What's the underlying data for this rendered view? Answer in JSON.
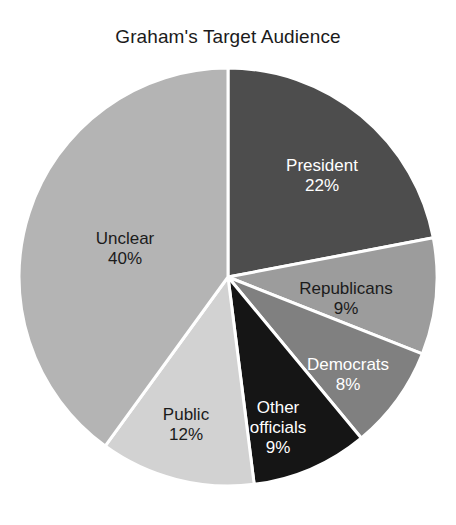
{
  "chart_data": {
    "type": "pie",
    "title": "Graham's Target Audience",
    "xlabel": "",
    "ylabel": "",
    "legend": "none",
    "grid": false,
    "start_angle_deg": 0,
    "direction": "clockwise",
    "categories": [
      "President",
      "Republicans",
      "Democrats",
      "Other officials",
      "Public",
      "Unclear"
    ],
    "values": [
      22,
      9,
      8,
      9,
      12,
      40
    ],
    "value_suffix": "%",
    "slices": [
      {
        "label": "President",
        "value": 22,
        "value_label": "22%",
        "color": "#4d4d4d",
        "text_color": "#ffffff",
        "label_x": 322,
        "label_y": 176
      },
      {
        "label": "Republicans",
        "value": 9,
        "value_label": "9%",
        "color": "#9c9c9c",
        "text_color": "#1b1b1b",
        "label_x": 346,
        "label_y": 299
      },
      {
        "label": "Democrats",
        "value": 8,
        "value_label": "8%",
        "color": "#808080",
        "text_color": "#ffffff",
        "label_x": 348,
        "label_y": 375
      },
      {
        "label": "Other officials",
        "value": 9,
        "value_label": "9%",
        "color": "#151515",
        "text_color": "#ffffff",
        "label_x": 278,
        "label_y": 428
      },
      {
        "label": "Public",
        "value": 12,
        "value_label": "12%",
        "color": "#d2d2d2",
        "text_color": "#1b1b1b",
        "label_x": 186,
        "label_y": 425
      },
      {
        "label": "Unclear",
        "value": 40,
        "value_label": "40%",
        "color": "#b4b4b4",
        "text_color": "#1b1b1b",
        "label_x": 125,
        "label_y": 249
      }
    ],
    "geometry": {
      "center_x": 228,
      "center_y": 277,
      "radius": 209,
      "separator_color": "#ffffff",
      "separator_width": 3
    }
  }
}
